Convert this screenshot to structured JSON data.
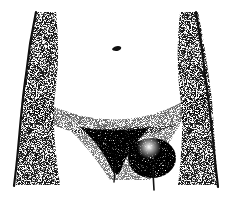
{
  "figure": {
    "colors": {
      "background": "#ffffff",
      "ink": "#111111"
    }
  }
}
